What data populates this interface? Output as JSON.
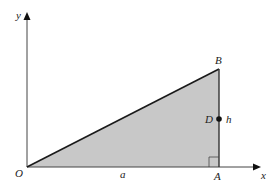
{
  "diagram": {
    "axes": {
      "x_label": "x",
      "y_label": "y"
    },
    "points": {
      "origin": "O",
      "A": "A",
      "B": "B",
      "D": "D"
    },
    "lengths": {
      "base": "a",
      "height": "h"
    },
    "colors": {
      "fill": "#c8c8c8",
      "stroke": "#1a1a1a",
      "axis": "#444444"
    }
  }
}
